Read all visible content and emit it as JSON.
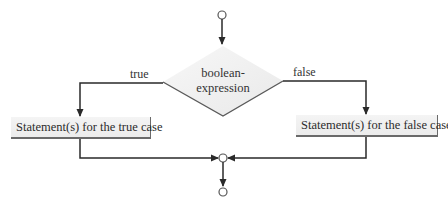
{
  "diagram": {
    "type": "flowchart",
    "title": "",
    "decision": {
      "line1": "boolean-",
      "line2": "expression"
    },
    "branches": {
      "true_label": "true",
      "false_label": "false"
    },
    "statements": {
      "true_case": "Statement(s) for the true case",
      "false_case": "Statement(s) for the false case"
    },
    "nodes": [
      {
        "id": "start",
        "shape": "circle"
      },
      {
        "id": "decision",
        "shape": "diamond",
        "text": "boolean-expression"
      },
      {
        "id": "true-stmt",
        "shape": "rectangle",
        "text": "Statement(s) for the true case"
      },
      {
        "id": "false-stmt",
        "shape": "rectangle",
        "text": "Statement(s) for the false case"
      },
      {
        "id": "merge",
        "shape": "circle"
      },
      {
        "id": "end",
        "shape": "circle"
      }
    ],
    "edges": [
      {
        "from": "start",
        "to": "decision",
        "label": ""
      },
      {
        "from": "decision",
        "to": "true-stmt",
        "label": "true"
      },
      {
        "from": "decision",
        "to": "false-stmt",
        "label": "false"
      },
      {
        "from": "true-stmt",
        "to": "merge",
        "label": ""
      },
      {
        "from": "false-stmt",
        "to": "merge",
        "label": ""
      },
      {
        "from": "merge",
        "to": "end",
        "label": ""
      }
    ],
    "colors": {
      "line": "#2a2a2a",
      "diamond_fill": "#efefef",
      "box_fill": "#f0f0f0",
      "box_shadow": "#6a6a6a"
    }
  }
}
